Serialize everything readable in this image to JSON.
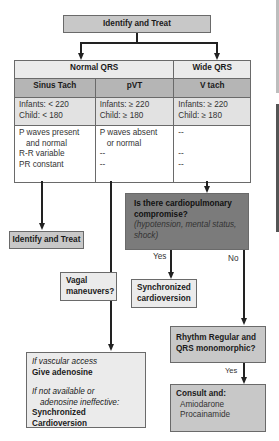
{
  "top_box": {
    "label": "Identify and Treat"
  },
  "table": {
    "group_headers": [
      "Normal QRS",
      "Wide QRS"
    ],
    "columns": [
      {
        "name": "Sinus Tach",
        "rates": [
          "Infants: < 220",
          "Child: < 180"
        ],
        "features": [
          "P waves present",
          "and normal",
          "R-R variable",
          "PR constant"
        ]
      },
      {
        "name": "pVT",
        "rates": [
          "Infants: ≥ 220",
          "Child: ≥ 180"
        ],
        "features": [
          "P waves absent",
          "or normal",
          "--",
          "--"
        ]
      },
      {
        "name": "V tach",
        "rates": [
          "Infants: ≥ 220",
          "Child: ≥ 180"
        ],
        "features": [
          "--",
          "",
          "--",
          "--"
        ]
      }
    ]
  },
  "sinus_result": {
    "label": "Identify and Treat"
  },
  "compromise_box": {
    "question_line1": "Is there cardiopulmonary",
    "question_line2": "compromise?",
    "detail_line1": "(hypotension, mental status,",
    "detail_line2": "shock)"
  },
  "branch_labels": {
    "yes": "Yes",
    "no": "No",
    "yes_bottom": "Yes"
  },
  "sync_cardioversion_box": {
    "line1": "Synchronized",
    "line2": "cardioversion"
  },
  "vagal_box": {
    "line1": "Vagal",
    "line2": "maneuvers?"
  },
  "adenosine_box": {
    "cond1": "If vascular access",
    "action1": "Give adenosine",
    "cond2_line1": "If not available or",
    "cond2_line2": "adenosine ineffective:",
    "action2": "Synchronized Cardioversion"
  },
  "rhythm_box": {
    "line1": "Rhythm Regular and",
    "line2": "QRS monomorphic?"
  },
  "consult_box": {
    "title": "Consult and:",
    "drugs": [
      "Amiodarone",
      "Procainamide"
    ]
  },
  "colors": {
    "light_box": "#c8c8c8",
    "dark_box": "#7b7b7b",
    "pale_box": "#ebebeb",
    "table_subheader": "#b5b5b5"
  }
}
